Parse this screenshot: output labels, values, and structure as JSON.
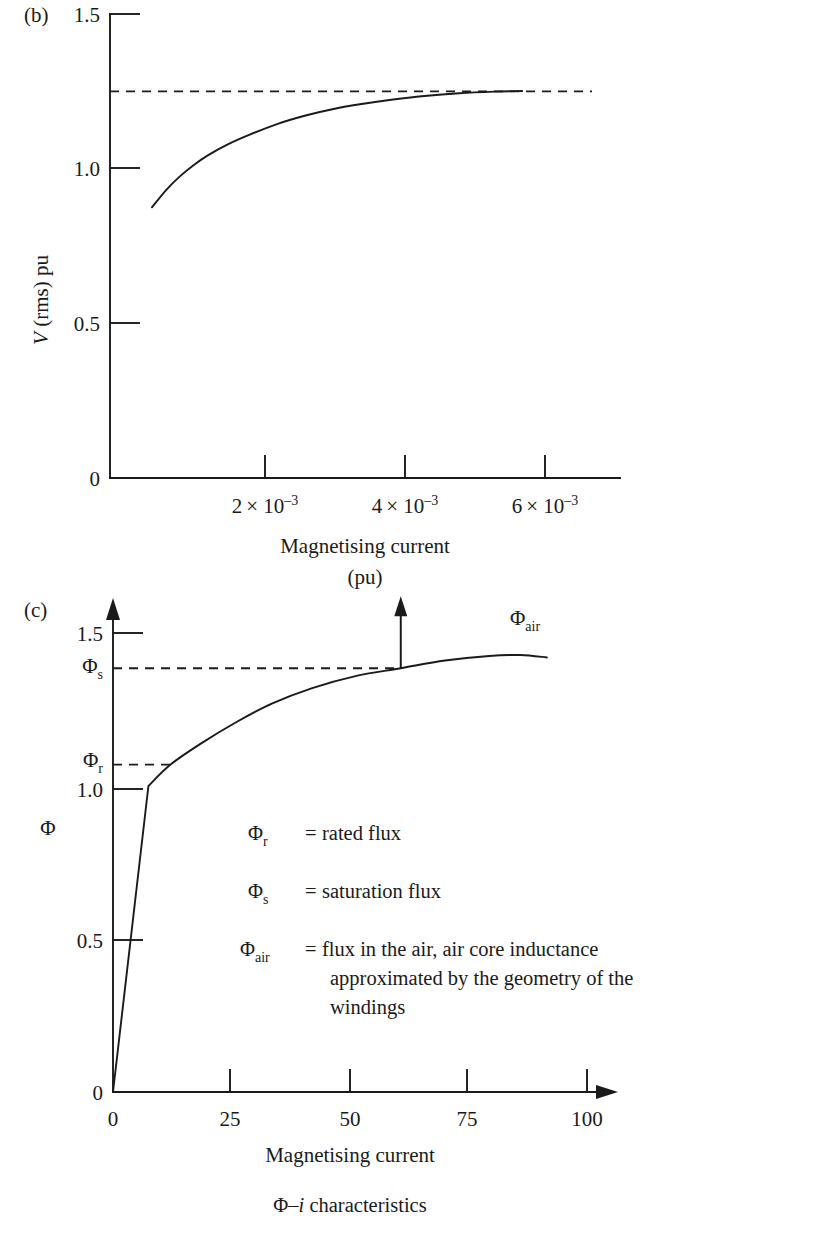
{
  "figure": {
    "caption": "Φ–i characteristics",
    "caption_symbol": "Φ–",
    "caption_italic": "i",
    "caption_rest": " characteristics"
  },
  "panel_b": {
    "tag": "(b)",
    "y_axis_label": "V (rms) pu",
    "y_axis_label_italic": "V",
    "y_axis_label_rest": " (rms) pu",
    "x_axis_label_line1": "Magnetising current",
    "x_axis_label_line2": "(pu)",
    "y_ticks": [
      "0",
      "0.5",
      "1.0",
      "1.5"
    ],
    "x_ticks": [
      "2 × 10⁻³",
      "4 × 10⁻³",
      "6 × 10⁻³"
    ],
    "x_tick_mantissas": [
      "2",
      "4",
      "6"
    ],
    "x_tick_base": "× 10",
    "x_tick_exponent": "–3",
    "asymptote_label": "1.25"
  },
  "panel_c": {
    "tag": "(c)",
    "y_axis_label": "Φ",
    "x_axis_label": "Magnetising current",
    "y_ticks": [
      "0",
      "0.5",
      "1.0",
      "1.5"
    ],
    "x_ticks": [
      "0",
      "25",
      "50",
      "75",
      "100"
    ],
    "marker_labels": [
      {
        "symbol": "Φ",
        "sub": "s"
      },
      {
        "symbol": "Φ",
        "sub": "r"
      },
      {
        "symbol": "Φ",
        "sub": "air"
      }
    ],
    "legend": [
      {
        "symbol": "Φ",
        "sub": "r",
        "eq": "=",
        "text": "rated  flux",
        "lines": [
          "rated  flux"
        ]
      },
      {
        "symbol": "Φ",
        "sub": "s",
        "eq": "=",
        "text": "saturation  flux",
        "lines": [
          "saturation  flux"
        ]
      },
      {
        "symbol": "Φ",
        "sub": "air",
        "eq": "=",
        "text": "flux in the air, air core inductance approximated by the geometry of the windings",
        "lines": [
          "flux in the air, air core inductance",
          "approximated by  the geometry of the",
          "windings"
        ]
      }
    ]
  },
  "chart_data": [
    {
      "id": "panel-b",
      "type": "line",
      "title": "(b) V (rms) pu versus magnetising current",
      "xlabel": "Magnetising current (pu)",
      "ylabel": "V (rms) pu",
      "xlim": [
        0,
        0.0073
      ],
      "ylim": [
        0,
        1.5
      ],
      "xtick_values": [
        0.002,
        0.004,
        0.006
      ],
      "xtick_labels": [
        "2 × 10⁻³",
        "4 × 10⁻³",
        "6 × 10⁻³"
      ],
      "ytick_values": [
        0,
        0.5,
        1.0,
        1.5
      ],
      "ytick_labels": [
        "0",
        "0.5",
        "1.0",
        "1.5"
      ],
      "grid": false,
      "legend": false,
      "annotations": [
        {
          "type": "hline",
          "y": 1.25,
          "style": "dashed",
          "x_from": 0.0,
          "x_to": 0.0069
        }
      ],
      "series": [
        {
          "name": "V (rms)",
          "style": "solid",
          "x": [
            0.0006,
            0.0008,
            0.001,
            0.0012,
            0.0014,
            0.0017,
            0.002,
            0.0024,
            0.0028,
            0.0032,
            0.0036,
            0.004,
            0.0045,
            0.005,
            0.0055,
            0.0059
          ],
          "y": [
            0.875,
            0.93,
            0.975,
            1.012,
            1.043,
            1.08,
            1.11,
            1.145,
            1.172,
            1.193,
            1.209,
            1.222,
            1.235,
            1.244,
            1.249,
            1.251
          ]
        }
      ]
    },
    {
      "id": "panel-c",
      "type": "line",
      "title": "(c) Φ–i characteristics",
      "xlabel": "Magnetising current",
      "ylabel": "Φ",
      "xlim": [
        0,
        110
      ],
      "ylim": [
        0,
        1.62
      ],
      "xtick_values": [
        0,
        25,
        50,
        75,
        100
      ],
      "xtick_labels": [
        "0",
        "25",
        "50",
        "75",
        "100"
      ],
      "ytick_values": [
        0,
        0.5,
        1.0,
        1.5
      ],
      "ytick_labels": [
        "0",
        "0.5",
        "1.0",
        "1.5"
      ],
      "grid": false,
      "legend": false,
      "annotations": [
        {
          "type": "hline",
          "label": "Φs",
          "y": 1.385,
          "style": "dashed",
          "x_from": 0.0,
          "x_to": 65
        },
        {
          "type": "hline",
          "label": "Φr",
          "y": 1.07,
          "style": "dashed",
          "x_from": 0.0,
          "x_to": 13
        },
        {
          "type": "arrow",
          "label": "Φair",
          "x": 65,
          "y_from": 1.385,
          "y_to": 1.62,
          "direction": "up"
        }
      ],
      "series": [
        {
          "name": "Φ–i curve",
          "style": "solid",
          "x": [
            0,
            8,
            13,
            20,
            28,
            36,
            45,
            55,
            65,
            75,
            85,
            92,
            98
          ],
          "y": [
            0,
            1.0,
            1.07,
            1.14,
            1.21,
            1.27,
            1.32,
            1.36,
            1.385,
            1.41,
            1.425,
            1.428,
            1.42
          ]
        }
      ]
    }
  ]
}
